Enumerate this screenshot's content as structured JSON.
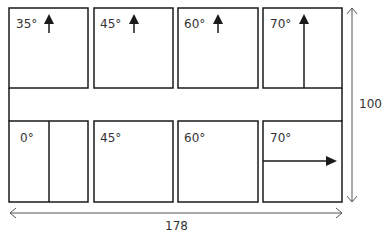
{
  "diagram": {
    "top_row": [
      {
        "angle": "35°",
        "arrow": "up-short"
      },
      {
        "angle": "45°",
        "arrow": "up-short"
      },
      {
        "angle": "60°",
        "arrow": "up-short"
      },
      {
        "angle": "70°",
        "arrow": "up-full-line"
      }
    ],
    "bottom_row": [
      {
        "angle": "0°",
        "divider": "vertical"
      },
      {
        "angle": "45°"
      },
      {
        "angle": "60°"
      },
      {
        "angle": "70°",
        "arrow": "right-full-line"
      }
    ],
    "dimensions": {
      "height_label": "100",
      "width_label": "178"
    },
    "colors": {
      "stroke": "#1a1a1a",
      "dimension_line": "#555555"
    }
  }
}
